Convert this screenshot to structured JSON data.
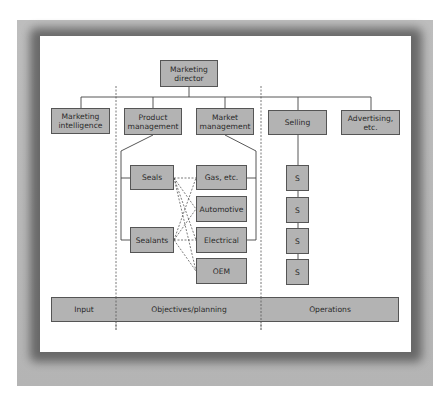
{
  "diagram": {
    "type": "organization-chart",
    "colors": {
      "node_fill": "#b3b3b3",
      "node_border": "#555555",
      "card_background": "#ffffff",
      "frame_gray": "#b8b8b8",
      "line": "#444444"
    },
    "top": {
      "director": "Marketing\ndirector"
    },
    "second_level": {
      "intelligence": "Marketing\nintelligence",
      "product_mgmt": "Product\nmanagement",
      "market_mgmt": "Market\nmanagement",
      "selling": "Selling",
      "advertising": "Advertising,\netc."
    },
    "products": {
      "seals": "Seals",
      "sealants": "Sealants"
    },
    "markets": {
      "gas": "Gas, etc.",
      "automotive": "Automotive",
      "electrical": "Electrical",
      "oem": "OEM"
    },
    "sales": {
      "s1": "S",
      "s2": "S",
      "s3": "S",
      "s4": "S"
    },
    "bottom_bar": {
      "input": "Input",
      "objectives": "Objectives/planning",
      "operations": "Operations"
    }
  }
}
